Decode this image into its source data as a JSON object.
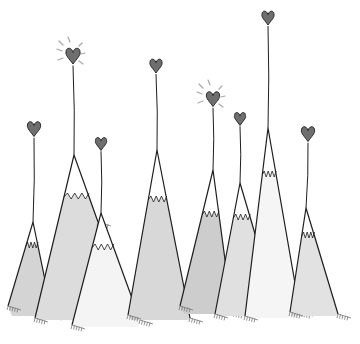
{
  "illustration": {
    "title": "Mountains with heart balloons",
    "background": "#ffffff",
    "colors": {
      "line": "#1e1e1e",
      "heart": "#6e6e6e",
      "snow_dark": "#cfcfcf",
      "snow_mid": "#dadada",
      "snow_light": "#e6e6e6",
      "white": "#ffffff",
      "ray": "#a8a8a8"
    },
    "mountains": [
      {
        "id": "m1",
        "peak": [
          33,
          222
        ],
        "left": [
          8,
          306
        ],
        "right": [
          52,
          314
        ],
        "fill": "#d4d4d4",
        "snowline": 246
      },
      {
        "id": "m2",
        "peak": [
          74,
          155
        ],
        "left": [
          35,
          318
        ],
        "right": [
          98,
          222
        ],
        "fill": "#dcdcdc",
        "snowline": 197
      },
      {
        "id": "m3",
        "peak": [
          101,
          213
        ],
        "left": [
          72,
          325
        ],
        "right": [
          140,
          320
        ],
        "fill": "#f4f4f4",
        "snowline": 248
      },
      {
        "id": "m4",
        "peak": [
          157,
          150
        ],
        "left": [
          128,
          315
        ],
        "right": [
          190,
          318
        ],
        "fill": "#d8d8d8",
        "snowline": 200
      },
      {
        "id": "m5",
        "peak": [
          213,
          170
        ],
        "left": [
          180,
          306
        ],
        "right": [
          232,
          312
        ],
        "fill": "#cdcdcd",
        "snowline": 215
      },
      {
        "id": "m6",
        "peak": [
          240,
          183
        ],
        "left": [
          215,
          314
        ],
        "right": [
          258,
          244
        ],
        "fill": "#e0e0e0",
        "snowline": 218
      },
      {
        "id": "m7",
        "peak": [
          268,
          128
        ],
        "left": [
          245,
          316
        ],
        "right": [
          300,
          312
        ],
        "fill": "#f5f5f5",
        "snowline": 175
      },
      {
        "id": "m8",
        "peak": [
          306,
          208
        ],
        "left": [
          290,
          312
        ],
        "right": [
          338,
          314
        ],
        "fill": "#e2e2e2",
        "snowline": 236
      }
    ],
    "balloons": [
      {
        "id": "h1",
        "x": 34,
        "y": 128,
        "size": 13,
        "string_to": [
          33,
          222
        ],
        "glow": false
      },
      {
        "id": "h2",
        "x": 73,
        "y": 55,
        "size": 14,
        "string_to": [
          74,
          155
        ],
        "glow": true
      },
      {
        "id": "h3",
        "x": 101,
        "y": 143,
        "size": 11,
        "string_to": [
          101,
          213
        ],
        "glow": false
      },
      {
        "id": "h4",
        "x": 156,
        "y": 65,
        "size": 12,
        "string_to": [
          157,
          150
        ],
        "glow": false
      },
      {
        "id": "h5",
        "x": 213,
        "y": 98,
        "size": 13,
        "string_to": [
          213,
          170
        ],
        "glow": true
      },
      {
        "id": "h6",
        "x": 240,
        "y": 118,
        "size": 11,
        "string_to": [
          240,
          183
        ],
        "glow": false
      },
      {
        "id": "h7",
        "x": 268,
        "y": 17,
        "size": 12,
        "string_to": [
          268,
          128
        ],
        "glow": false
      },
      {
        "id": "h8",
        "x": 308,
        "y": 133,
        "size": 13,
        "string_to": [
          306,
          208
        ],
        "glow": false
      }
    ]
  }
}
